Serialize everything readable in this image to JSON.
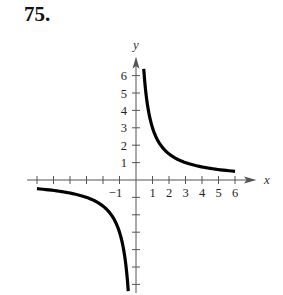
{
  "problem": {
    "number": "75."
  },
  "chart_data": {
    "type": "line",
    "title": "",
    "function": "y = 3/x",
    "xlabel": "x",
    "ylabel": "y",
    "xlim": [
      -6.5,
      7
    ],
    "ylim": [
      -6.5,
      7
    ],
    "x_tick_labels": [
      "-1",
      "1",
      "2",
      "3",
      "4",
      "5",
      "6"
    ],
    "y_tick_labels": [
      "1",
      "2",
      "3",
      "4",
      "5",
      "6"
    ],
    "grid": false,
    "series": [
      {
        "name": "right-branch",
        "x": [
          0.47,
          0.6,
          0.75,
          1,
          1.5,
          2,
          3,
          4,
          5,
          6
        ],
        "y": [
          6.4,
          5,
          4,
          3,
          2,
          1.5,
          1,
          0.75,
          0.6,
          0.5
        ]
      },
      {
        "name": "left-branch",
        "x": [
          -6,
          -5,
          -4,
          -3,
          -2,
          -1.5,
          -1,
          -0.75,
          -0.6,
          -0.47
        ],
        "y": [
          -0.5,
          -0.6,
          -0.75,
          -1,
          -1.5,
          -2,
          -3,
          -4,
          -5,
          -6.4
        ]
      }
    ]
  }
}
